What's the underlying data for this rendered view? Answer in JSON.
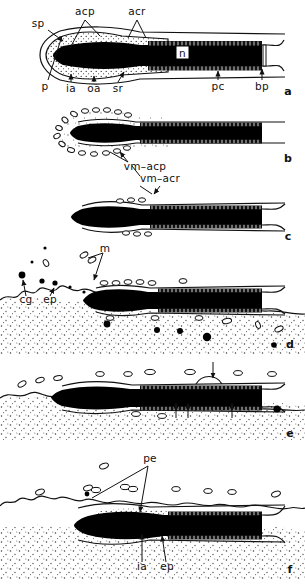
{
  "figure": {
    "width": 305,
    "height": 586,
    "background_color": "#ffffff",
    "ink_color": "#000000"
  },
  "panels": [
    {
      "letter": "a",
      "caption_position": "bottom-right",
      "description": "Intact spermatozoon head with acrosome, perforatorium and nucleus",
      "labels": [
        {
          "id": "sp",
          "text": "sp",
          "x": 38,
          "y": 27
        },
        {
          "id": "acp",
          "text": "acp",
          "x": 78,
          "y": 15
        },
        {
          "id": "acr",
          "text": "acr",
          "x": 131,
          "y": 15
        },
        {
          "id": "p",
          "text": "p",
          "x": 45,
          "y": 86
        },
        {
          "id": "ia",
          "text": "ia",
          "x": 69,
          "y": 88
        },
        {
          "id": "oa",
          "text": "oa",
          "x": 92,
          "y": 88
        },
        {
          "id": "sr",
          "text": "sr",
          "x": 117,
          "y": 88
        },
        {
          "id": "n",
          "text": "n",
          "x": 182,
          "y": 52
        },
        {
          "id": "pc",
          "text": "pc",
          "x": 214,
          "y": 86
        },
        {
          "id": "bp",
          "text": "bp",
          "x": 259,
          "y": 86
        }
      ]
    },
    {
      "letter": "b",
      "caption_position": "bottom-right",
      "description": "Vesiculation of acrosomal membranes at sperm apex",
      "labels": [
        {
          "id": "vm-acp",
          "text": "vm–acp",
          "x": 124,
          "y": 167
        },
        {
          "id": "vm-acr",
          "text": "vm–acr",
          "x": 138,
          "y": 180
        }
      ]
    },
    {
      "letter": "c",
      "caption_position": "bottom-right",
      "description": "Acrosomal cap shed, inner acrosomal membrane exposed",
      "labels": []
    },
    {
      "letter": "d",
      "caption_position": "bottom-right",
      "description": "Sperm head within stippled egg cytoplasm, microvilli and cortical granules",
      "labels": [
        {
          "id": "m",
          "text": "m",
          "x": 105,
          "y": 249
        },
        {
          "id": "cg",
          "text": "cg",
          "x": 24,
          "y": 299
        },
        {
          "id": "ep",
          "text": "ep",
          "x": 48,
          "y": 299
        }
      ]
    },
    {
      "letter": "e",
      "caption_position": "bottom-right",
      "description": "Sperm head incorporated, arrows mark fusion sites",
      "labels": [],
      "arrow_count": 4
    },
    {
      "letter": "f",
      "caption_position": "bottom-right",
      "description": "Perinuclear envelope forming around incorporated nucleus",
      "labels": [
        {
          "id": "pe",
          "text": "pe",
          "x": 146,
          "y": 459
        },
        {
          "id": "ia",
          "text": "ia",
          "x": 141,
          "y": 566
        },
        {
          "id": "ep",
          "text": "ep",
          "x": 167,
          "y": 566
        }
      ]
    }
  ],
  "panel_letters": {
    "a": "a",
    "b": "b",
    "c": "c",
    "d": "d",
    "e": "e",
    "f": "f"
  },
  "abbreviations": {
    "sp": "sp",
    "acp": "acp",
    "acr": "acr",
    "p": "p",
    "ia": "ia",
    "oa": "oa",
    "sr": "sr",
    "n": "n",
    "pc": "pc",
    "bp": "bp",
    "vm_acp": "vm–acp",
    "vm_acr": "vm–acr",
    "m": "m",
    "cg": "cg",
    "ep": "ep",
    "pe": "pe"
  }
}
